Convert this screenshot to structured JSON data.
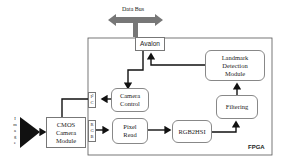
{
  "diagram": {
    "data_bus": "Data Bus",
    "avalon": "Avalon",
    "landmark": "Landmark Detection Module",
    "camera_control": "Camera Control",
    "filtering": "Filtering",
    "cmos": "CMOS Camera Module",
    "pixel_read": "Pixel Read",
    "rgb2hsi": "RGB2HSI",
    "fpga": "FPGA",
    "port_ic": [
      "I²",
      "C"
    ],
    "port_rgb": [
      "R",
      "G",
      "B"
    ],
    "image_label": [
      "I",
      "m",
      "a",
      "g",
      "e"
    ]
  }
}
